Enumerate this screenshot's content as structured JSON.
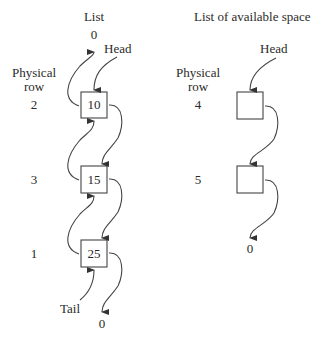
{
  "list": {
    "title": "List",
    "head_label": "Head",
    "tail_label": "Tail",
    "top_null": "0",
    "bottom_null": "0",
    "physical_row_label_line1": "Physical",
    "physical_row_label_line2": "row",
    "nodes": [
      {
        "row": "2",
        "value": "10"
      },
      {
        "row": "3",
        "value": "15"
      },
      {
        "row": "1",
        "value": "25"
      }
    ]
  },
  "available": {
    "title": "List of available space",
    "head_label": "Head",
    "bottom_null": "0",
    "physical_row_label_line1": "Physical",
    "physical_row_label_line2": "row",
    "nodes": [
      {
        "row": "4",
        "value": ""
      },
      {
        "row": "5",
        "value": ""
      }
    ]
  }
}
